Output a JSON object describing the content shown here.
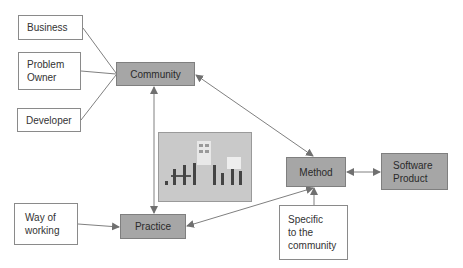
{
  "diagram": {
    "nodes": {
      "business": {
        "label": "Business"
      },
      "problem_owner": {
        "label": "Problem\nOwner"
      },
      "developer": {
        "label": "Developer"
      },
      "community": {
        "label": "Community"
      },
      "practice": {
        "label": "Practice"
      },
      "way_of_working": {
        "label": "Way of\nworking"
      },
      "method": {
        "label": "Method"
      },
      "software_product": {
        "label": "Software\nProduct"
      },
      "specific": {
        "label": "Specific\nto the\ncommunity"
      }
    },
    "image": {
      "description": "team-collaboration-illustration"
    },
    "edges": [
      {
        "from": "business",
        "to": "community",
        "arrow": "none"
      },
      {
        "from": "problem_owner",
        "to": "community",
        "arrow": "none"
      },
      {
        "from": "developer",
        "to": "community",
        "arrow": "none"
      },
      {
        "from": "community",
        "to": "practice",
        "arrow": "both"
      },
      {
        "from": "community",
        "to": "method",
        "arrow": "both"
      },
      {
        "from": "method",
        "to": "practice",
        "arrow": "both"
      },
      {
        "from": "way_of_working",
        "to": "practice",
        "arrow": "end"
      },
      {
        "from": "method",
        "to": "software_product",
        "arrow": "both"
      },
      {
        "from": "specific",
        "to": "method",
        "arrow": "end"
      }
    ],
    "colors": {
      "node_fill": "#a6a6a6",
      "line": "#7a7a7a",
      "box_border": "#8a8a8a"
    }
  }
}
